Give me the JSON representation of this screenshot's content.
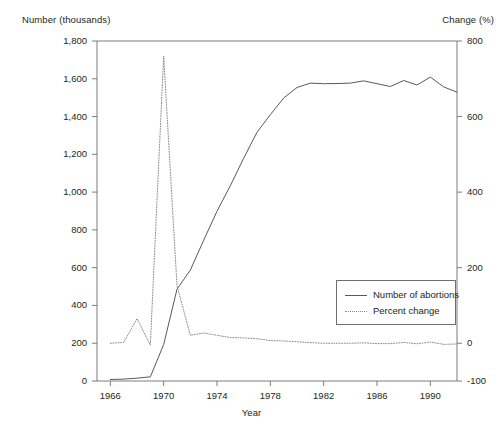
{
  "chart_data": {
    "type": "line",
    "title": "",
    "subtitle": "",
    "xlabel": "Year",
    "ylabel": "Number (thousands)",
    "y2label": "Change (%)",
    "grid": false,
    "legend_position": "inside-right-lower",
    "xlim": [
      1965,
      1992
    ],
    "ylim": [
      0,
      1800
    ],
    "y2lim": [
      -100,
      800
    ],
    "xticks": [
      1966,
      1970,
      1974,
      1978,
      1982,
      1986,
      1990
    ],
    "xtick_labels": [
      "1966",
      "1970",
      "1974",
      "1978",
      "1982",
      "1986",
      "1990"
    ],
    "yticks": [
      0,
      200,
      400,
      600,
      800,
      1000,
      1200,
      1400,
      1600,
      1800
    ],
    "ytick_labels": [
      "0",
      "200",
      "400",
      "600",
      "800",
      "1,000",
      "1,200",
      "1,400",
      "1,600",
      "1,800"
    ],
    "y2ticks": [
      -100,
      0,
      200,
      400,
      600,
      800
    ],
    "y2tick_labels": [
      "-100",
      "0",
      "200",
      "400",
      "600",
      "800"
    ],
    "x": [
      1966,
      1967,
      1968,
      1969,
      1970,
      1971,
      1972,
      1973,
      1974,
      1975,
      1976,
      1977,
      1978,
      1979,
      1980,
      1981,
      1982,
      1983,
      1984,
      1985,
      1986,
      1987,
      1988,
      1989,
      1990,
      1991,
      1992
    ],
    "series": [
      {
        "name": "Number of abortions",
        "axis": "left",
        "style": "solid",
        "color": "#58595b",
        "values": [
          8,
          10,
          15,
          22,
          193,
          486,
          587,
          745,
          899,
          1034,
          1179,
          1317,
          1410,
          1498,
          1554,
          1577,
          1574,
          1575,
          1577,
          1589,
          1574,
          1559,
          1591,
          1567,
          1609,
          1557,
          1529
        ]
      },
      {
        "name": "Percent change",
        "axis": "right",
        "style": "dotted",
        "color": "#8a8c8e",
        "values": [
          0,
          2,
          65,
          -5,
          760,
          152,
          21,
          27,
          21,
          15,
          14,
          12,
          7,
          6,
          4,
          1.5,
          0,
          0,
          0,
          1,
          -1,
          -1,
          2,
          -1.5,
          3,
          -3,
          -2
        ]
      }
    ],
    "legend": [
      {
        "label": "Number of abortions",
        "style": "solid"
      },
      {
        "label": "Percent change",
        "style": "dotted"
      }
    ]
  },
  "axes": {
    "left_title": "Number (thousands)",
    "right_title": "Change (%)",
    "x_title": "Year"
  }
}
